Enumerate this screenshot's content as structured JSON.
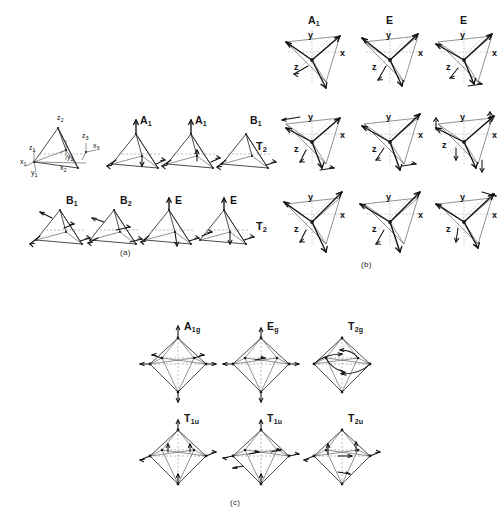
{
  "figure": {
    "background_color": "#ffffff",
    "line_color": "#2b2b2b",
    "arrow_color": "#111111",
    "dash_color": "#8a8a8a"
  },
  "panels": [
    {
      "id": "a",
      "caption": "(a)",
      "geometry": "tetragonal-pyramid",
      "reference_axes": [
        {
          "name": "z2",
          "label": "z",
          "sub": "2"
        },
        {
          "name": "z3",
          "label": "z",
          "sub": "3"
        },
        {
          "name": "x3",
          "label": "x",
          "sub": "3"
        },
        {
          "name": "z1",
          "label": "z",
          "sub": "1"
        },
        {
          "name": "x1",
          "label": "x",
          "sub": "1"
        },
        {
          "name": "y1",
          "label": "y",
          "sub": "1"
        },
        {
          "name": "y2",
          "label": "y",
          "sub": "2"
        },
        {
          "name": "x2",
          "label": "x",
          "sub": "2"
        }
      ],
      "rows": [
        {
          "row_label": "",
          "modes": [
            {
              "label": "",
              "sub": "",
              "kind": "reference"
            },
            {
              "label": "A",
              "sub": "1",
              "kind": "mode"
            },
            {
              "label": "A",
              "sub": "1",
              "kind": "mode"
            },
            {
              "label": "B",
              "sub": "1",
              "kind": "mode"
            }
          ]
        },
        {
          "row_label": "",
          "modes": [
            {
              "label": "B",
              "sub": "1",
              "kind": "mode"
            },
            {
              "label": "B",
              "sub": "2",
              "kind": "mode"
            },
            {
              "label": "E",
              "sub": "",
              "kind": "mode"
            },
            {
              "label": "E",
              "sub": "",
              "kind": "mode"
            }
          ]
        }
      ]
    },
    {
      "id": "b",
      "caption": "(b)",
      "geometry": "tetrahedral",
      "axis_labels": [
        "x",
        "y",
        "z"
      ],
      "rows": [
        {
          "row_label": "",
          "row_label_sub": "",
          "modes": [
            {
              "label": "A",
              "sub": "1"
            },
            {
              "label": "E",
              "sub": ""
            },
            {
              "label": "E",
              "sub": ""
            }
          ]
        },
        {
          "row_label": "T",
          "row_label_sub": "2",
          "modes": [
            {
              "label": "",
              "sub": ""
            },
            {
              "label": "",
              "sub": ""
            },
            {
              "label": "",
              "sub": ""
            }
          ]
        },
        {
          "row_label": "T",
          "row_label_sub": "2",
          "modes": [
            {
              "label": "",
              "sub": ""
            },
            {
              "label": "",
              "sub": ""
            },
            {
              "label": "",
              "sub": ""
            }
          ]
        }
      ]
    },
    {
      "id": "c",
      "caption": "(c)",
      "geometry": "octahedral",
      "rows": [
        {
          "modes": [
            {
              "label": "A",
              "sub": "1g"
            },
            {
              "label": "E",
              "sub": "g"
            },
            {
              "label": "T",
              "sub": "2g"
            }
          ]
        },
        {
          "modes": [
            {
              "label": "T",
              "sub": "1u"
            },
            {
              "label": "T",
              "sub": "1u"
            },
            {
              "label": "T",
              "sub": "2u"
            }
          ]
        }
      ]
    }
  ]
}
